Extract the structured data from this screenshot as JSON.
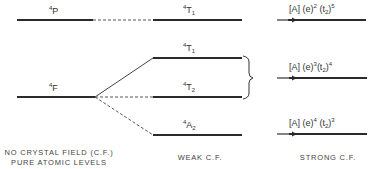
{
  "diagram": {
    "free_ion": {
      "levels": [
        {
          "term_sup": "4",
          "term": "P"
        },
        {
          "term_sup": "4",
          "term": "F"
        }
      ],
      "caption_line1": "NO CRYSTAL FIELD (C.F.)",
      "caption_line2": "PURE ATOMIC LEVELS"
    },
    "weak_field": {
      "levels": [
        {
          "term_sup": "4",
          "term": "T",
          "term_sub": "1",
          "origin": "4P"
        },
        {
          "term_sup": "4",
          "term": "T",
          "term_sub": "1",
          "origin": "4F"
        },
        {
          "term_sup": "4",
          "term": "T",
          "term_sub": "2",
          "origin": "4F"
        },
        {
          "term_sup": "4",
          "term": "A",
          "term_sub": "2",
          "origin": "4F"
        }
      ],
      "caption": "WEAK C.F."
    },
    "strong_field": {
      "levels": [
        {
          "core": "[A]",
          "e_label": "(e)",
          "e_exp": "2",
          "t_label": "(t",
          "t_sub": "2",
          "t_close": ")",
          "t_exp": "5"
        },
        {
          "core": "[A]",
          "e_label": "(e)",
          "e_exp": "3",
          "t_label": "(t",
          "t_sub": "2",
          "t_close": ")",
          "t_exp": "4"
        },
        {
          "core": "[A]",
          "e_label": "(e)",
          "e_exp": "4",
          "t_label": "(t",
          "t_sub": "2",
          "t_close": ")",
          "t_exp": "3"
        }
      ],
      "caption": "STRONG C.F."
    },
    "colors": {
      "line": "#2a2a2a",
      "text": "#333333"
    }
  }
}
